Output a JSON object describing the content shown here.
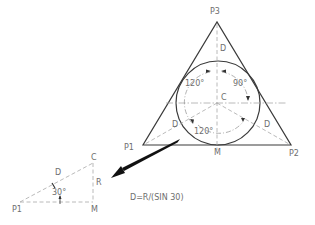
{
  "diagram": {
    "main_triangle": {
      "vertices": {
        "p1": "P1",
        "p2": "P2",
        "p3": "P3"
      },
      "center_label": "C",
      "midpoint_label": "M",
      "distance_labels": {
        "top": "D",
        "left": "D",
        "right": "D"
      },
      "angles": {
        "upper_left": "120°",
        "upper_right": "90°",
        "bottom": "120°"
      }
    },
    "detail_triangle": {
      "vertices": {
        "p1": "P1",
        "c": "C",
        "m": "M"
      },
      "hypotenuse_label": "D",
      "side_label": "R",
      "angle_label": "30°"
    },
    "formula": "D=R/(SIN 30)",
    "colors": {
      "line": "#3a3a3a",
      "construction": "#a8a8a8",
      "text": "#6e6e6e",
      "arrow": "#111111"
    }
  }
}
